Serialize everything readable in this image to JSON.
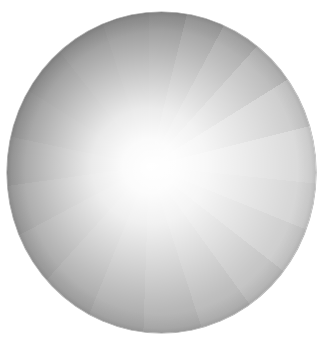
{
  "artwork": {
    "shape": "circle",
    "description": "Gray disc with radial white glow and radiating wedge segments",
    "bounds": {
      "left": 7,
      "top": 12,
      "width": 309,
      "height": 321
    },
    "highlight_center": {
      "x": 150,
      "y": 165
    },
    "colors": {
      "background": "#ffffff",
      "highlight": "#ffffff",
      "darkest_wedge": "#707070",
      "lightest_wedge": "#d2d2d2",
      "edge": "#505050"
    },
    "wedge_count": 20
  }
}
